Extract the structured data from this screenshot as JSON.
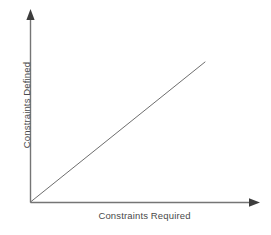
{
  "chart_data": {
    "type": "line",
    "title": "",
    "subtitle": "",
    "xlabel": "Constraints Required",
    "ylabel": "Constraints Defined",
    "grid": false,
    "legend": null,
    "legend_position": "none",
    "x_tick_labels": [],
    "y_tick_labels": [],
    "xlim": [
      0,
      1
    ],
    "ylim": [
      0,
      1
    ],
    "axis_arrows": {
      "x": "right",
      "y": "up"
    },
    "annotations": [],
    "series": [
      {
        "name": "ideal 1:1 relationship",
        "x": [
          0,
          1
        ],
        "y": [
          0,
          1
        ],
        "style": "straight-line",
        "color": "#6e6e6e",
        "width": 1
      }
    ]
  },
  "colors": {
    "background": "#ffffff",
    "axis": "#757575",
    "line": "#6e6e6e",
    "text": "#4a4a4a"
  }
}
